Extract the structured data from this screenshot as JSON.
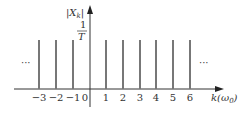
{
  "diagram": {
    "y_label": "|X",
    "y_label_sub": "k",
    "y_label_close": "|",
    "amplitude_label_num": "1",
    "amplitude_label_den": "T",
    "x_label": "k(ω",
    "x_label_sub": "0",
    "x_label_close": ")",
    "ellipsis_left": "···",
    "ellipsis_right": "···",
    "ticks": [
      {
        "k": -3,
        "label": "−3",
        "x": 39
      },
      {
        "k": -2,
        "label": "−2",
        "x": 56
      },
      {
        "k": -1,
        "label": "−1",
        "x": 73
      },
      {
        "k": 0,
        "label": "0",
        "x": 85
      },
      {
        "k": 1,
        "label": "1",
        "x": 106
      },
      {
        "k": 2,
        "label": "2",
        "x": 123
      },
      {
        "k": 3,
        "label": "3",
        "x": 140
      },
      {
        "k": 4,
        "label": "4",
        "x": 156
      },
      {
        "k": 5,
        "label": "5",
        "x": 173
      },
      {
        "k": 6,
        "label": "6",
        "x": 190
      }
    ],
    "impulse_color": "#777777",
    "axis_color": "#333333"
  }
}
